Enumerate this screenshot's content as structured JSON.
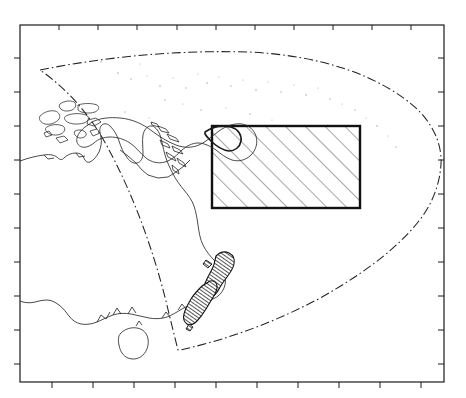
{
  "figure": {
    "title": "",
    "width": 466,
    "height": 398,
    "background_color": "#ffffff",
    "projection_note": "conic / sector map of the South-West Pacific",
    "region_name": "South-West Pacific Ocean"
  },
  "frame": {
    "name": "plot-frame",
    "x": 20,
    "y": 25,
    "width": 424,
    "height": 357,
    "stroke_color": "#1a1a1a",
    "stroke_width": 1.2,
    "fill": "none",
    "tick_color": "#1a1a1a",
    "tick_length": 5
  },
  "axes": {
    "top_ticks_x": [
      59,
      98,
      137,
      177,
      216,
      255,
      294,
      333,
      372,
      411
    ],
    "bottom_ticks_x": [
      52,
      93,
      134,
      175,
      216,
      257,
      298,
      339,
      380,
      421
    ],
    "left_ticks_y": [
      58,
      92,
      126,
      160,
      194,
      228,
      262,
      296,
      330,
      364
    ],
    "right_ticks_y": [
      58,
      92,
      126,
      160,
      194,
      228,
      262,
      296,
      330,
      364
    ],
    "tick_labels_shown": false
  },
  "study_area": {
    "name": "hatched-study-area",
    "label": "",
    "x": 212,
    "y": 126,
    "width": 148,
    "height": 82,
    "stroke_color": "#111111",
    "stroke_width": 2.4,
    "fill": "none",
    "hatch_color": "#3a3a3a",
    "hatch_width": 0.9,
    "hatch_angle_deg": 45,
    "hatch_spacing": 14
  },
  "boundary": {
    "name": "survey-boundary-sector",
    "style": "dash-dot",
    "stroke_color": "#222222",
    "stroke_width": 1.0,
    "dash_pattern": "9 3 1.5 3",
    "vertices": {
      "apex_west": [
        40,
        70
      ],
      "apex_south": [
        178,
        350
      ]
    },
    "path": "M 40 70 L 210 54 Q 300 48 360 72 Q 420 98 441 160 Q 441 196 430 215 L 441 220 Q 392 265 318 301 Q 250 331 186 348 L 178 350 L 160 300 Q 132 204 84 120 Z"
  },
  "landmasses": [
    {
      "name": "australia",
      "label": "Australia",
      "shaded": false
    },
    {
      "name": "tasmania",
      "label": "Tasmania",
      "shaded": false
    },
    {
      "name": "new-guinea",
      "label": "New Guinea",
      "shaded": false
    },
    {
      "name": "indonesia-islands",
      "label": "Indonesia",
      "shaded": false
    },
    {
      "name": "solomon-islands",
      "label": "Solomon Islands",
      "shaded": false
    },
    {
      "name": "new-zealand-north-island",
      "label": "North Island",
      "shaded": true
    },
    {
      "name": "new-zealand-south-island",
      "label": "South Island",
      "shaded": true
    }
  ],
  "colors": {
    "coastline": "#2a2a2a",
    "shaded_land_fill": "#5a5a5a",
    "shaded_land_stroke": "#111111",
    "frame": "#1a1a1a",
    "hatch": "#3a3a3a",
    "island_dot": "#9a9a9a"
  }
}
